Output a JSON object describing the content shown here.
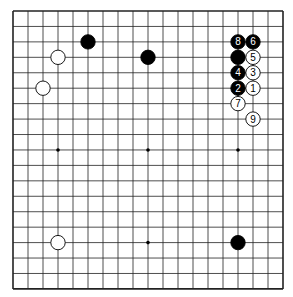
{
  "board": {
    "size": 19,
    "left": 13,
    "top": 11,
    "dx": 15,
    "dy": 15.44
  },
  "star_points": [
    [
      3,
      3
    ],
    [
      9,
      3
    ],
    [
      15,
      3
    ],
    [
      3,
      9
    ],
    [
      9,
      9
    ],
    [
      15,
      9
    ],
    [
      3,
      15
    ],
    [
      9,
      15
    ],
    [
      15,
      15
    ]
  ],
  "stones": [
    {
      "c": "b",
      "x": 5,
      "y": 2,
      "n": ""
    },
    {
      "c": "b",
      "x": 9,
      "y": 3,
      "n": ""
    },
    {
      "c": "w",
      "x": 3,
      "y": 3,
      "n": ""
    },
    {
      "c": "w",
      "x": 2,
      "y": 5,
      "n": ""
    },
    {
      "c": "w",
      "x": 3,
      "y": 15,
      "n": ""
    },
    {
      "c": "b",
      "x": 15,
      "y": 15,
      "n": ""
    },
    {
      "c": "b",
      "x": 15,
      "y": 3,
      "n": ""
    },
    {
      "c": "w",
      "x": 16,
      "y": 5,
      "n": "1"
    },
    {
      "c": "b",
      "x": 15,
      "y": 5,
      "n": "2"
    },
    {
      "c": "w",
      "x": 16,
      "y": 4,
      "n": "3"
    },
    {
      "c": "b",
      "x": 15,
      "y": 4,
      "n": "4"
    },
    {
      "c": "w",
      "x": 16,
      "y": 3,
      "n": "5"
    },
    {
      "c": "b",
      "x": 16,
      "y": 2,
      "n": "6"
    },
    {
      "c": "w",
      "x": 15,
      "y": 6,
      "n": "7"
    },
    {
      "c": "b",
      "x": 15,
      "y": 2,
      "n": "8"
    },
    {
      "c": "w",
      "x": 16,
      "y": 7,
      "n": "9"
    }
  ]
}
